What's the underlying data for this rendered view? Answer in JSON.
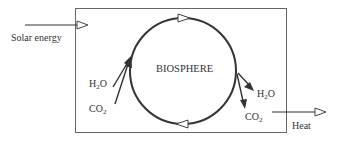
{
  "diagram": {
    "center_label": "BIOSPHERE",
    "inputs": {
      "energy_label": "Solar energy",
      "water": {
        "base": "H",
        "sub": "2",
        "rest": "O"
      },
      "carbon": {
        "base": "CO",
        "sub": "2",
        "rest": ""
      }
    },
    "outputs": {
      "water": {
        "base": "H",
        "sub": "2",
        "rest": "O"
      },
      "carbon": {
        "base": "CO",
        "sub": "2",
        "rest": ""
      },
      "heat_label": "Heat"
    },
    "colors": {
      "line": "#333333",
      "box": "#555555",
      "background": "#ffffff"
    }
  }
}
